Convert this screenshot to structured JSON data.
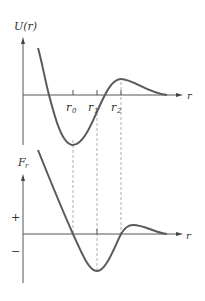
{
  "figure": {
    "top_plot": {
      "y_label": "U(r)",
      "x_label": "r",
      "tick_labels": [
        "r",
        "r",
        "r"
      ],
      "tick_subscripts": [
        "0",
        "1",
        "2"
      ],
      "curve": "potential energy U(r)"
    },
    "bottom_plot": {
      "y_label": "F",
      "y_label_subscript": "r",
      "x_label": "r",
      "positive_sign": "+",
      "negative_sign": "−",
      "curve": "radial force F_r"
    },
    "colors": {
      "curve": "#5a5a5a",
      "axis": "#555555",
      "dashed": "#888888",
      "text": "#333333"
    }
  }
}
